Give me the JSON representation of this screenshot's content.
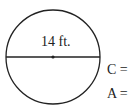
{
  "diagram": {
    "shape": "circle",
    "diameter_label": "14 ft.",
    "colors": {
      "stroke": "#222222",
      "background": "#ffffff"
    }
  },
  "formulas": {
    "circumference_label": "C =",
    "area_label": "A ="
  }
}
